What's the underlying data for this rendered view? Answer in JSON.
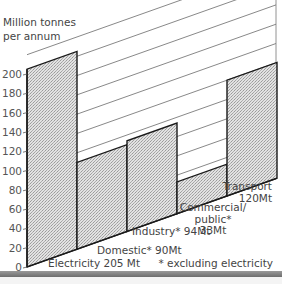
{
  "chart_data": {
    "type": "bar",
    "title": "",
    "ylabel": "Million tonnes per annum",
    "xlabel": "",
    "ylim": [
      0,
      220
    ],
    "yticks": [
      0,
      20,
      40,
      60,
      80,
      100,
      120,
      140,
      160,
      180,
      200
    ],
    "grid": true,
    "style": "oblique (slanted baseline) bar chart",
    "categories": [
      "Electricity",
      "Domestic*",
      "Industry*",
      "Commercial/public*",
      "Transport"
    ],
    "values": [
      205,
      90,
      94,
      33,
      120
    ],
    "labels": [
      [
        "Electricity 205 Mt"
      ],
      [
        "Domestic* 90Mt"
      ],
      [
        "Industry* 94Mt"
      ],
      [
        "Commercial/",
        "public*",
        "33Mt"
      ],
      [
        "Transport",
        "120Mt"
      ]
    ],
    "annotations": [
      "* excluding electricity"
    ],
    "legend": null
  },
  "ui": {
    "ylabel_line1": "Million tonnes",
    "ylabel_line2": "per annum",
    "footnote": "* excluding electricity"
  },
  "colors": {
    "bar_fill": "#d4d4d4",
    "bar_stroke": "#1a1a1a",
    "grid": "#555555",
    "text": "#444444"
  }
}
